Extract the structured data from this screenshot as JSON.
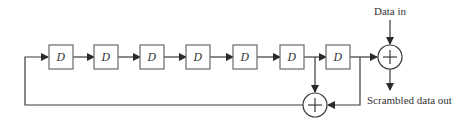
{
  "diagram": {
    "type": "scrambler-shift-register",
    "register_count": 7,
    "registers": [
      {
        "label": "D"
      },
      {
        "label": "D"
      },
      {
        "label": "D"
      },
      {
        "label": "D"
      },
      {
        "label": "D"
      },
      {
        "label": "D"
      },
      {
        "label": "D"
      }
    ],
    "labels": {
      "data_in": "Data in",
      "data_out": "Scrambled data out"
    },
    "xor_symbol": "+",
    "colors": {
      "line": "#3a3a3a",
      "box_border": "#6a6a6a",
      "background": "#ffffff"
    }
  }
}
